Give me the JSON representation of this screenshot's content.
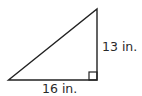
{
  "diagram": {
    "type": "right-triangle",
    "colors": {
      "stroke": "#222222",
      "text": "#2a2a2a",
      "background": "#ffffff"
    },
    "vertices": {
      "left": [
        8.5,
        80
      ],
      "top": [
        97,
        9
      ],
      "right_angle": [
        97,
        80
      ]
    },
    "right_angle_marker": {
      "x": 89,
      "y": 72,
      "size": 8
    },
    "labels": {
      "vertical_side": "13 in.",
      "horizontal_side": "16 in."
    }
  }
}
